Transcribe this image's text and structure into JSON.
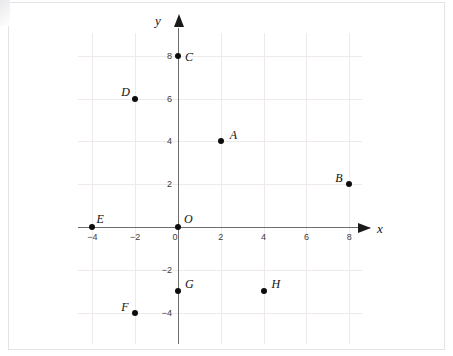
{
  "figure": {
    "type": "coordinate-plane",
    "width": 453,
    "height": 356,
    "background_color": "#ffffff",
    "grid_color": "#efeaea",
    "axis_color": "#6d6d6d",
    "point_color": "#0d0d0d"
  },
  "axes": {
    "x_label": "x",
    "y_label": "y",
    "origin_label": "O",
    "x_ticks": [
      "−4",
      "−2",
      "0",
      "2",
      "4",
      "6",
      "8"
    ],
    "y_ticks": [
      "8",
      "6",
      "4",
      "2",
      "−2",
      "−4"
    ]
  },
  "chart_data": {
    "type": "scatter",
    "title": "",
    "xlabel": "x",
    "ylabel": "y",
    "xlim": [
      -5,
      9
    ],
    "ylim": [
      -5,
      9
    ],
    "xticks": [
      -4,
      -2,
      0,
      2,
      4,
      6,
      8
    ],
    "yticks": [
      8,
      6,
      4,
      2,
      -2,
      -4
    ],
    "xticklabels": [
      "−4",
      "−2",
      "0",
      "2",
      "4",
      "6",
      "8"
    ],
    "yticklabels": [
      "8",
      "6",
      "4",
      "2",
      "−2",
      "−4"
    ],
    "grid": true,
    "grid_spacing": 2,
    "legend": false,
    "series": [
      {
        "name": "labeled points",
        "points": [
          {
            "label": "A",
            "x": 2,
            "y": 4,
            "label_dx": 9,
            "label_dy": -12
          },
          {
            "label": "B",
            "x": 8,
            "y": 2,
            "label_dx": -14,
            "label_dy": -12
          },
          {
            "label": "C",
            "x": 0,
            "y": 8,
            "label_dx": 7,
            "label_dy": -5
          },
          {
            "label": "D",
            "x": -2,
            "y": 6,
            "label_dx": -14,
            "label_dy": -13
          },
          {
            "label": "E",
            "x": -4,
            "y": 0,
            "label_dx": 4,
            "label_dy": -14
          },
          {
            "label": "F",
            "x": -2,
            "y": -4,
            "label_dx": -14,
            "label_dy": -12
          },
          {
            "label": "G",
            "x": 0,
            "y": -3,
            "label_dx": 7,
            "label_dy": -13
          },
          {
            "label": "H",
            "x": 4,
            "y": -3,
            "label_dx": 8,
            "label_dy": -13
          }
        ]
      }
    ]
  }
}
